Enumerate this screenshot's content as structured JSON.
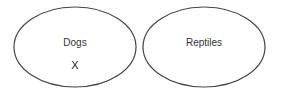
{
  "diagram": {
    "type": "venn-separate-sets",
    "stroke_color": "#444444",
    "sets": [
      {
        "label": "Dogs",
        "items": [
          "X"
        ]
      },
      {
        "label": "Reptiles",
        "items": []
      }
    ]
  }
}
